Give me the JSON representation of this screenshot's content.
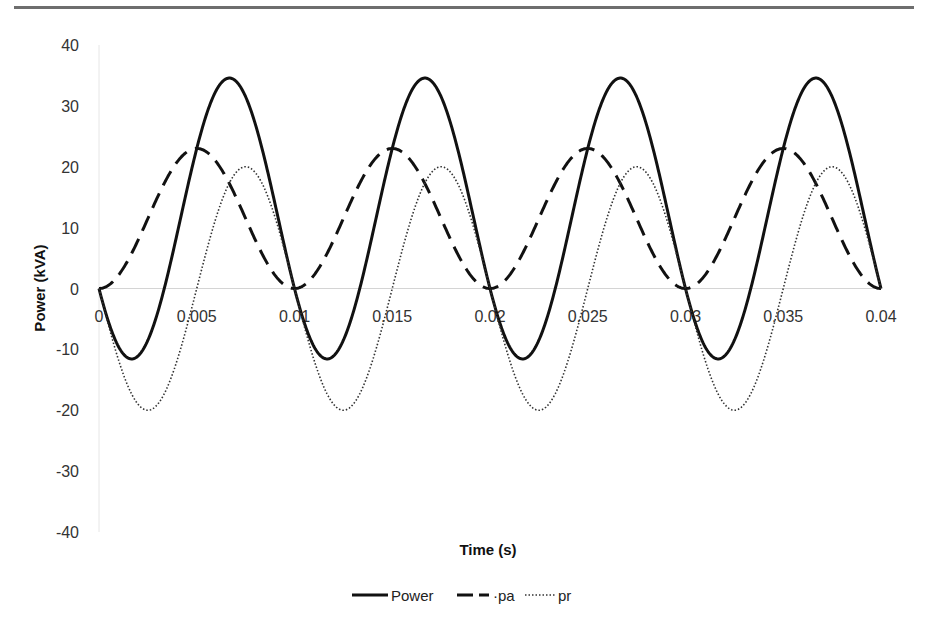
{
  "chart_data": {
    "type": "line",
    "title": "",
    "xlabel": "Time (s)",
    "ylabel": "Power (kVA)",
    "xlim": [
      0,
      0.04
    ],
    "ylim": [
      -40,
      40
    ],
    "x_ticks": [
      "0",
      "0.005",
      "0.01",
      "0.015",
      "0.02",
      "0.025",
      "0.03",
      "0.035",
      "0.04"
    ],
    "y_ticks": [
      "40",
      "30",
      "20",
      "10",
      "0",
      "-10",
      "-20",
      "-30",
      "-40"
    ],
    "grid": false,
    "zero_line": true,
    "legend_position": "bottom",
    "x": [
      0,
      0.0005,
      0.001,
      0.0015,
      0.002,
      0.0025,
      0.003,
      0.0035,
      0.004,
      0.0045,
      0.005,
      0.0055,
      0.006,
      0.0065,
      0.007,
      0.0075,
      0.008,
      0.0085,
      0.009,
      0.0095,
      0.01
    ],
    "series": [
      {
        "name": "Power",
        "style": "solid",
        "description": "Periodic with period 0.01 s; min ≈ -11.6 at t≈0.0017+k·0.01, max ≈ 34.6 at t≈0.0067+k·0.01",
        "values": [
          0,
          -5.9,
          -10.1,
          -11.6,
          -10.3,
          -8.5,
          -0.4,
          7.4,
          17.4,
          26.2,
          32.1,
          34.6,
          33.4,
          30.4,
          24.6,
          20.0,
          12.1,
          5.4,
          1.0,
          -0.6,
          0
        ]
      },
      {
        "name": "pa",
        "style": "dashed",
        "description": "pa = 11.5·(1 − cos(2π t / 0.01)); range 0..23",
        "values": [
          0,
          0.3,
          1.1,
          2.4,
          4.0,
          5.8,
          7.7,
          9.8,
          11.5,
          13.5,
          23.0,
          21.9,
          19.8,
          17.0,
          15.3,
          11.5,
          7.7,
          4.0,
          2.4,
          0.3,
          0
        ]
      },
      {
        "name": "pr",
        "style": "dotted",
        "description": "pr = −20·sin(2π t / 0.01); range −20..20",
        "values": [
          0,
          -6.2,
          -11.8,
          -16.2,
          -19.0,
          -20.0,
          -19.0,
          -16.2,
          -11.8,
          -6.2,
          0,
          6.2,
          11.8,
          16.2,
          19.0,
          20.0,
          19.0,
          16.2,
          11.8,
          6.2,
          0
        ]
      }
    ],
    "formulas": {
      "pa": "11.5*(1-cos(2*pi*t/0.01))",
      "pr": "-20*sin(2*pi*t/0.01)",
      "Power": "pa + pr"
    },
    "legend": [
      "Power",
      "pa",
      "pr"
    ]
  }
}
